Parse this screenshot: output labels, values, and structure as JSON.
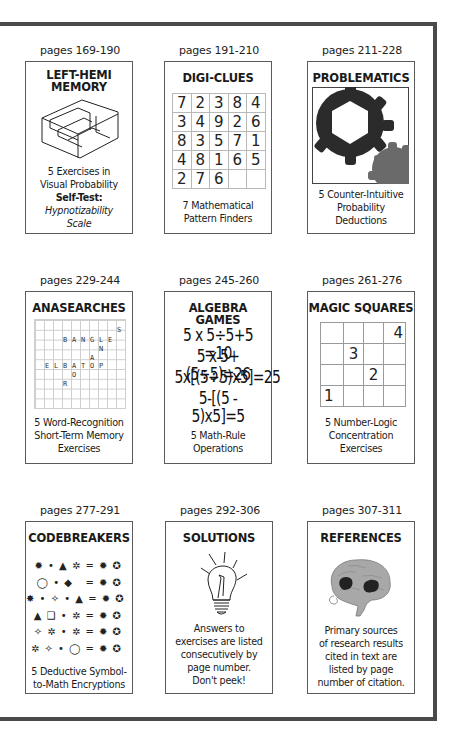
{
  "frame": {
    "border_color": "#4a4a4a"
  },
  "cards": [
    {
      "pages": "pages 169-190",
      "title_lines": [
        "LEFT-HEMI",
        "MEMORY"
      ],
      "icon": "isometric-stairs-icon",
      "desc_lines": [
        "5 Exercises in",
        "Visual Probability"
      ],
      "desc_bold": "Self-Test:",
      "desc_italic_lines": [
        "Hypnotizability",
        "Scale"
      ]
    },
    {
      "pages": "pages 191-210",
      "title": "DIGI-CLUES",
      "grid": [
        [
          "7",
          "2",
          "3",
          "8",
          "4"
        ],
        [
          "3",
          "4",
          "9",
          "2",
          "6"
        ],
        [
          "8",
          "3",
          "5",
          "7",
          "1"
        ],
        [
          "4",
          "8",
          "1",
          "6",
          "5"
        ],
        [
          "2",
          "7",
          "6",
          "",
          ""
        ]
      ],
      "desc_lines": [
        "7 Mathematical",
        "Pattern Finders"
      ]
    },
    {
      "pages": "pages 211-228",
      "title": "PROBLEMATICS",
      "icon": "gears-icon",
      "desc_lines": [
        "5 Counter-Intuitive",
        "Probability",
        "Deductions"
      ]
    },
    {
      "pages": "pages 229-244",
      "title": "ANASEARCHES",
      "letters": [
        {
          "c": "S",
          "x": 82,
          "y": 6
        },
        {
          "c": "B",
          "x": 28,
          "y": 16
        },
        {
          "c": "A",
          "x": 37,
          "y": 16
        },
        {
          "c": "N",
          "x": 46,
          "y": 16
        },
        {
          "c": "G",
          "x": 55,
          "y": 16
        },
        {
          "c": "L",
          "x": 64,
          "y": 16
        },
        {
          "c": "E",
          "x": 73,
          "y": 16
        },
        {
          "c": "N",
          "x": 64,
          "y": 25
        },
        {
          "c": "A",
          "x": 55,
          "y": 34
        },
        {
          "c": "E",
          "x": 10,
          "y": 42
        },
        {
          "c": "L",
          "x": 19,
          "y": 42
        },
        {
          "c": "B",
          "x": 28,
          "y": 42
        },
        {
          "c": "A",
          "x": 37,
          "y": 42
        },
        {
          "c": "T",
          "x": 46,
          "y": 42
        },
        {
          "c": "O",
          "x": 55,
          "y": 42
        },
        {
          "c": "P",
          "x": 64,
          "y": 42
        },
        {
          "c": "O",
          "x": 37,
          "y": 51
        },
        {
          "c": "R",
          "x": 28,
          "y": 60
        }
      ],
      "desc_lines": [
        "5 Word-Recognition",
        "Short-Term Memory",
        "Exercises"
      ]
    },
    {
      "pages": "pages 245-260",
      "title": "ALGEBRA GAMES",
      "equations": [
        "5 x 5÷5+5 =10",
        "5 x 5+(5÷5)=26",
        "5x[(5÷5)x5]=25",
        "5-[(5 - 5)x5]=5"
      ],
      "desc_lines": [
        "5 Math-Rule",
        "Operations"
      ]
    },
    {
      "pages": "pages 261-276",
      "title": "MAGIC SQUARES",
      "grid": [
        [
          "",
          "",
          "",
          "4"
        ],
        [
          "",
          "3",
          "",
          ""
        ],
        [
          "",
          "",
          "2",
          ""
        ],
        [
          "1",
          "",
          "",
          ""
        ]
      ],
      "desc_lines": [
        "5 Number-Logic",
        "Concentration",
        "Exercises"
      ]
    },
    {
      "pages": "pages 277-291",
      "title": "CODEBREAKERS",
      "code_rows": [
        "✹ • ▲ ✲ = ✹ ✪",
        "◯ • ◆   = ✹ ✪",
        "✸ • ✧ • ▲ = ✹ ✪",
        "▲ ❑ • ✲ = ✹ ✪",
        "✧ ✲ • ✲ = ✹ ✪",
        "✲ ✧ • ◯ = ✹ ✪"
      ],
      "desc_lines": [
        "5 Deductive Symbol-",
        "to-Math Encryptions"
      ]
    },
    {
      "pages": "pages 292-306",
      "title": "SOLUTIONS",
      "icon": "lightbulb-icon",
      "desc_lines": [
        "Answers to",
        "exercises are listed",
        "consecutively by",
        "page number.",
        "Don't peek!"
      ]
    },
    {
      "pages": "pages 307-311",
      "title": "REFERENCES",
      "icon": "brain-icon",
      "desc_lines": [
        "Primary sources",
        "of research results",
        "cited in text are",
        "listed by page",
        "number of citation."
      ]
    }
  ]
}
